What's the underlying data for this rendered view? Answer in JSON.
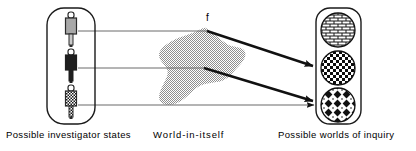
{
  "figure": {
    "function_label": "f",
    "captions": {
      "left": "Possible investigator states",
      "middle": "World-in-itself",
      "right": "Possible worlds of inquiry"
    },
    "colors": {
      "stroke": "#1a1a1a",
      "blob_fill": "#9e9e9e",
      "key_light": "#a8a8a8",
      "key_dark": "#1f1f1f",
      "background": "#ffffff",
      "arrow": "#111111"
    },
    "left_container": {
      "name": "possible-investigator-states-container",
      "shape": "rounded-rectangle",
      "items": [
        {
          "id": "state-1",
          "icon": "key-light-icon",
          "fill": "light-gray",
          "label": "investigator state 1"
        },
        {
          "id": "state-2",
          "icon": "key-dark-icon",
          "fill": "dark",
          "label": "investigator state 2"
        },
        {
          "id": "state-3",
          "icon": "key-hatched-icon",
          "fill": "checkered",
          "label": "investigator state 3"
        }
      ]
    },
    "middle_region": {
      "name": "world-in-itself-blob",
      "shape": "irregular-blob",
      "fill": "gray-stipple"
    },
    "right_container": {
      "name": "possible-worlds-of-inquiry-container",
      "shape": "rounded-rectangle",
      "items": [
        {
          "id": "world-1",
          "icon": "brick-pattern-circle-icon",
          "pattern": "brick",
          "label": "possible world 1"
        },
        {
          "id": "world-2",
          "icon": "checkerboard-circle-icon",
          "pattern": "checkerboard",
          "label": "possible world 2"
        },
        {
          "id": "world-3",
          "icon": "diamond-grid-circle-icon",
          "pattern": "diamond-grid",
          "label": "possible world 3"
        }
      ]
    },
    "connections": [
      {
        "id": "conn-1",
        "from": "state-1",
        "via": "world-in-itself",
        "to": "world-2",
        "style": "thin-line-then-thick-arrow"
      },
      {
        "id": "conn-2",
        "from": "state-2",
        "via": "world-in-itself",
        "to": "world-3",
        "style": "thin-line-then-thick-arrow"
      },
      {
        "id": "conn-3",
        "from": "state-3",
        "via": "direct",
        "to": "world-3",
        "style": "thin-line-with-arrowhead"
      }
    ]
  }
}
